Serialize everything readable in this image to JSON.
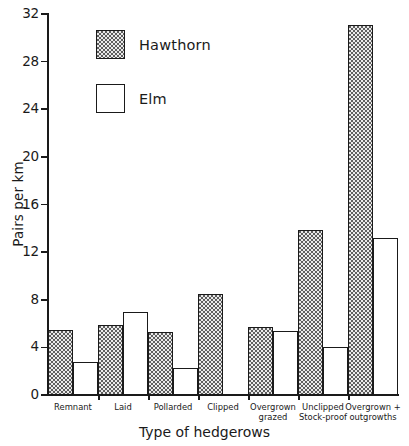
{
  "chart_data": {
    "type": "bar",
    "title": "",
    "xlabel": "Type of hedgerows",
    "ylabel": "Pairs per km",
    "ylim": [
      0,
      32
    ],
    "yticks": [
      0,
      4,
      8,
      12,
      16,
      20,
      24,
      28,
      32
    ],
    "grid": false,
    "legend_position": "upper-left-inside",
    "categories": [
      "Remnant",
      "Laid",
      "Pollarded",
      "Clipped",
      "Overgrown grazed",
      "Unclipped Stock-proof",
      "Overgrown + outgrowths"
    ],
    "category_lines": [
      [
        "Remnant"
      ],
      [
        "Laid"
      ],
      [
        "Pollarded"
      ],
      [
        "Clipped"
      ],
      [
        "Overgrown",
        "grazed"
      ],
      [
        "Unclipped",
        "Stock-proof"
      ],
      [
        "Overgrown +",
        "outgrowths"
      ]
    ],
    "series": [
      {
        "name": "Hawthorn",
        "fill": "stipple",
        "values": [
          5.5,
          5.9,
          5.3,
          8.5,
          5.7,
          13.9,
          31.1
        ]
      },
      {
        "name": "Elm",
        "fill": "white",
        "values": [
          2.8,
          7.0,
          2.3,
          0,
          5.4,
          4.0,
          13.2
        ]
      }
    ]
  },
  "legend": {
    "items": [
      {
        "label": "Hawthorn",
        "swatch": "hawthorn-swatch"
      },
      {
        "label": "Elm",
        "swatch": "elm-swatch"
      }
    ]
  },
  "axes": {
    "y_title": "Pairs per km",
    "x_title": "Type of hedgerows",
    "y_tick_labels": [
      "0",
      "4",
      "8",
      "12",
      "16",
      "20",
      "24",
      "28",
      "32"
    ]
  },
  "colors": {
    "ink": "#1a1a1a",
    "background": "#ffffff",
    "stipple_fill": "#e9e9e9",
    "stipple_dot": "#5d5d5d"
  }
}
